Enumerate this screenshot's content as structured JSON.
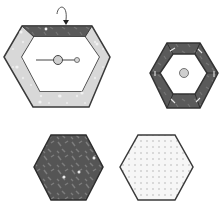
{
  "diagram": {
    "colors": {
      "outline": "#3a3a3a",
      "dark_fill": "#555555",
      "dark_texture": "#7a7a7a",
      "light_frame": "#d9d9d9",
      "white": "#ffffff",
      "dot_fill": "#f4f4f4",
      "dot": "#b8b8b8",
      "circle": "#cfcfcf"
    },
    "shapes": [
      {
        "id": "large-frame-hexagon",
        "fill": "light frame with dark top band",
        "has_arrow": true,
        "has_lever": true
      },
      {
        "id": "small-dark-frame-hexagon",
        "fill": "dark frame with white center and knob",
        "segments": 6
      },
      {
        "id": "dark-textured-hexagon",
        "fill": "dark speckled"
      },
      {
        "id": "dotted-hexagon",
        "fill": "white dotted"
      }
    ]
  }
}
